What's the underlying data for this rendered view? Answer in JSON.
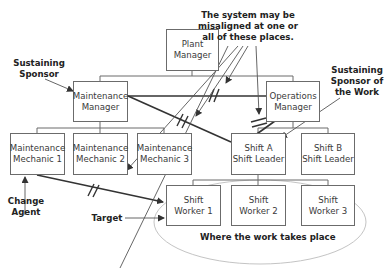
{
  "diagram": {
    "nodes": {
      "plant_manager": {
        "line1": "Plant",
        "line2": "Manager"
      },
      "maintenance_manager": {
        "line1": "Maintenance",
        "line2": "Manager"
      },
      "operations_manager": {
        "line1": "Operations",
        "line2": "Manager"
      },
      "mechanic_1": {
        "line1": "Maintenance",
        "line2": "Mechanic 1"
      },
      "mechanic_2": {
        "line1": "Maintenance",
        "line2": "Mechanic 2"
      },
      "mechanic_3": {
        "line1": "Maintenance",
        "line2": "Mechanic 3"
      },
      "shift_a_leader": {
        "line1": "Shift A",
        "line2": "Shift Leader"
      },
      "shift_b_leader": {
        "line1": "Shift B",
        "line2": "Shift Leader"
      },
      "worker_1": {
        "line1": "Shift",
        "line2": "Worker 1"
      },
      "worker_2": {
        "line1": "Shift",
        "line2": "Worker 2"
      },
      "worker_3": {
        "line1": "Shift",
        "line2": "Worker 3"
      }
    },
    "annotations": {
      "misaligned": {
        "line1": "The system may be",
        "line2": "misaligned at one or",
        "line3": "all of these places."
      },
      "sustaining_sponsor": {
        "line1": "Sustaining",
        "line2": "Sponsor"
      },
      "sustaining_sponsor_work": {
        "line1": "Sustaining",
        "line2": "Sponsor of",
        "line3": "the Work"
      },
      "change_agent": {
        "line1": "Change",
        "line2": "Agent"
      },
      "target": {
        "text": "Target"
      },
      "work_place": {
        "text": "Where the work takes place"
      }
    },
    "colors": {
      "box_border": "#6b6b6b",
      "thick_line": "#333333",
      "thin_line": "#555555",
      "ellipse": "#bdbdbd",
      "text": "#222222"
    }
  }
}
